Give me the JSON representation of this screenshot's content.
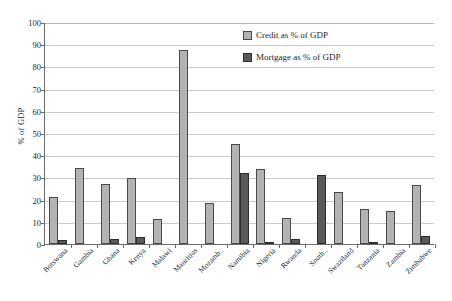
{
  "chart_data": {
    "type": "bar",
    "title": "",
    "xlabel": "",
    "ylabel": "% of GDP",
    "ylim": [
      0,
      100
    ],
    "yticks": [
      0,
      10,
      20,
      30,
      40,
      50,
      60,
      70,
      80,
      90,
      100
    ],
    "grid": true,
    "legend_position": "top-right",
    "categories": [
      "Botswana",
      "Gambia",
      "Ghana",
      "Kenya",
      "Malawi",
      "Mauritius",
      "Mozamb..",
      "Namibia",
      "Nigeria",
      "Rwanda",
      "South..",
      "Swaziland",
      "Tanzania",
      "Zambia",
      "Zimbabwe"
    ],
    "series": [
      {
        "name": "Credit as % of GDP",
        "color": "#b3b3b3",
        "values": [
          21.0,
          34.2,
          27.2,
          29.8,
          11.2,
          87.5,
          18.3,
          45.2,
          33.8,
          11.5,
          0,
          23.3,
          15.8,
          14.7,
          26.5
        ]
      },
      {
        "name": "Mortgage as % of GDP",
        "color": "#595959",
        "values": [
          1.9,
          0,
          2.3,
          3.0,
          0,
          0,
          0,
          31.9,
          0.8,
          2.2,
          31.2,
          0,
          0.7,
          0,
          3.5
        ]
      }
    ]
  },
  "legend": {
    "items": [
      {
        "label": "Credit as % of GDP",
        "swatch": "credit"
      },
      {
        "label": "Mortgage as % of GDP",
        "swatch": "mortgage"
      }
    ]
  },
  "axis": {
    "y_title": "% of GDP"
  }
}
